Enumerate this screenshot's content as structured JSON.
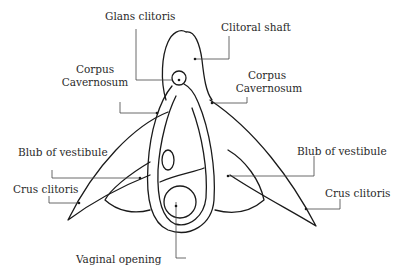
{
  "diagram": {
    "labels": {
      "glans_clitoris": "Glans clitoris",
      "clitoral_shaft": "Clitoral shaft",
      "corpus_cavernosum_left_1": "Corpus",
      "corpus_cavernosum_left_2": "Cavernosum",
      "corpus_cavernosum_right_1": "Corpus",
      "corpus_cavernosum_right_2": "Cavernosum",
      "bulb_vestibule_left": "Blub of vestibule",
      "bulb_vestibule_right": "Blub of vestibule",
      "crus_clitoris_left": "Crus clitoris",
      "crus_clitoris_right": "Crus clitoris",
      "vaginal_opening": "Vaginal opening"
    },
    "colors": {
      "stroke": "#1a1a1a",
      "leader": "#444444",
      "background": "#ffffff"
    }
  }
}
